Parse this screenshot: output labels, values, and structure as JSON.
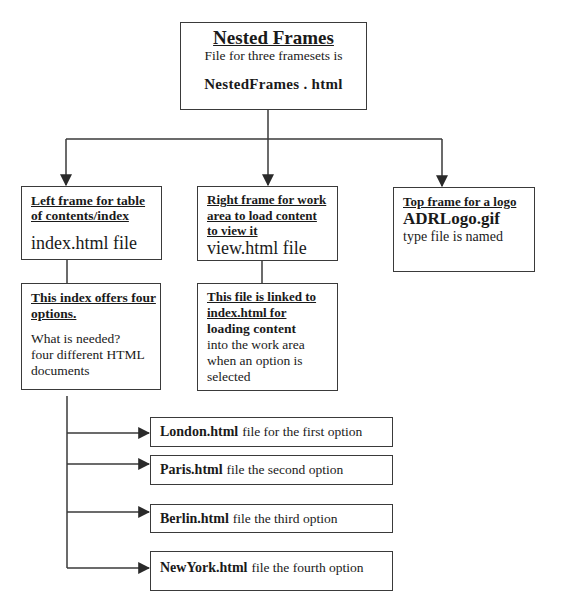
{
  "root": {
    "title": "Nested Frames",
    "subtitle": "File for three framesets is",
    "file": "NestedFrames . html"
  },
  "frames": [
    {
      "id": "left",
      "heading": "Left frame for table of contents/index",
      "heading_lines": [
        "Left frame for table",
        "of contents/index"
      ],
      "file": "index.html file"
    },
    {
      "id": "right",
      "heading": "Right frame for work area to load content to view it",
      "heading_lines": [
        "Right frame for work",
        "area to load content",
        "to view it"
      ],
      "file": "view.html file"
    },
    {
      "id": "top",
      "heading": "Top frame for a logo",
      "file": "ADRLogo.gif",
      "note": "type file is named"
    }
  ],
  "index_detail": {
    "heading_lines": [
      "This index offers four",
      "options."
    ],
    "body_lines": [
      "What is needed?",
      "four different HTML",
      "documents"
    ]
  },
  "view_detail": {
    "heading_lines": [
      "This file is linked to",
      "index.html for"
    ],
    "bold_line": "loading content",
    "body_lines": [
      "into the work area",
      "when an option is",
      "selected"
    ]
  },
  "options": [
    {
      "file": "London.html",
      "desc": "file for the first option"
    },
    {
      "file": "Paris.html",
      "desc": "file the second option"
    },
    {
      "file": "Berlin.html",
      "desc": "file the third option"
    },
    {
      "file": "NewYork.html",
      "desc": "file the fourth option"
    }
  ],
  "colors": {
    "line": "#3a3a3a",
    "text": "#1a1a1a",
    "background": "#ffffff"
  }
}
